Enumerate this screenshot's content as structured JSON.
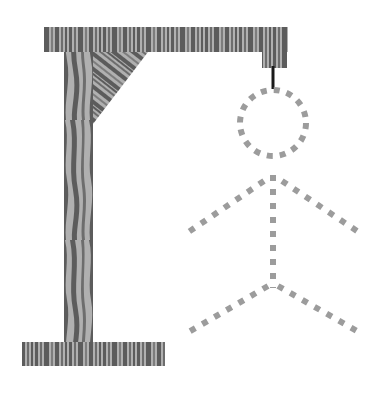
{
  "illustration": {
    "title": "Hangman gallows with dashed stick figure",
    "subject": "hangman-game-gallows",
    "canvas": {
      "width": 384,
      "height": 399,
      "background": "#ffffff"
    }
  },
  "palette": {
    "background": "#ffffff",
    "wood_light": "#b0b0b0",
    "wood_dark": "#5c5c5c",
    "wood_mid": "#8a8a8a",
    "rope": "#1a1a1a",
    "figure_dash": "#9c9c9c"
  },
  "gallows": {
    "label": "Wooden gallows frame",
    "material": "wood-grain",
    "parts": [
      {
        "name": "top-beam",
        "label": "Top horizontal beam",
        "x": 44,
        "y": 27,
        "width": 244,
        "height": 25,
        "grain": "vertical-stripes"
      },
      {
        "name": "hanger-tab",
        "label": "Beam end tab",
        "x": 262,
        "y": 52,
        "width": 25,
        "height": 16,
        "grain": "vertical-stripes"
      },
      {
        "name": "vertical-post",
        "label": "Vertical post",
        "x": 64,
        "y": 27,
        "width": 29,
        "height": 315,
        "grain": "wavy-vertical"
      },
      {
        "name": "diagonal-brace",
        "label": "Diagonal corner brace",
        "points": "93,52 148,52 93,124",
        "grain": "diagonal-stripes"
      },
      {
        "name": "base-beam",
        "label": "Base horizontal beam",
        "x": 22,
        "y": 342,
        "width": 143,
        "height": 24,
        "grain": "vertical-stripes"
      }
    ]
  },
  "rope": {
    "name": "rope",
    "label": "Hanging rope",
    "x": 273,
    "y1": 66,
    "y2": 89,
    "color": "#1a1a1a",
    "width": 3
  },
  "figure": {
    "label": "Dashed stick figure (unfilled hangman)",
    "style": {
      "stroke": "#9c9c9c",
      "width": 6,
      "dash": "6 8",
      "linecap": "butt"
    },
    "parts": [
      {
        "name": "head",
        "label": "Head",
        "shape": "circle",
        "cx": 273,
        "cy": 123,
        "r": 33
      },
      {
        "name": "torso",
        "label": "Torso",
        "shape": "line",
        "x1": 273,
        "y1": 175,
        "x2": 273,
        "y2": 288
      },
      {
        "name": "left-arm",
        "label": "Left arm",
        "shape": "line",
        "x1": 264,
        "y1": 181,
        "x2": 187,
        "y2": 233
      },
      {
        "name": "right-arm",
        "label": "Right arm",
        "shape": "line",
        "x1": 282,
        "y1": 181,
        "x2": 357,
        "y2": 231
      },
      {
        "name": "left-leg",
        "label": "Left leg",
        "shape": "line",
        "x1": 268,
        "y1": 286,
        "x2": 187,
        "y2": 333
      },
      {
        "name": "right-leg",
        "label": "Right leg",
        "shape": "line",
        "x1": 278,
        "y1": 286,
        "x2": 357,
        "y2": 331
      }
    ]
  },
  "chart_data": {
    "type": "diagram",
    "elements": [
      {
        "id": "top-beam",
        "kind": "wood-beam",
        "orientation": "horizontal"
      },
      {
        "id": "vertical-post",
        "kind": "wood-beam",
        "orientation": "vertical"
      },
      {
        "id": "diagonal-brace",
        "kind": "wood-triangle",
        "orientation": "diagonal"
      },
      {
        "id": "base-beam",
        "kind": "wood-beam",
        "orientation": "horizontal"
      },
      {
        "id": "rope",
        "kind": "solid-line",
        "orientation": "vertical"
      },
      {
        "id": "head",
        "kind": "dashed-circle"
      },
      {
        "id": "torso",
        "kind": "dashed-line"
      },
      {
        "id": "left-arm",
        "kind": "dashed-line"
      },
      {
        "id": "right-arm",
        "kind": "dashed-line"
      },
      {
        "id": "left-leg",
        "kind": "dashed-line"
      },
      {
        "id": "right-leg",
        "kind": "dashed-line"
      }
    ]
  }
}
